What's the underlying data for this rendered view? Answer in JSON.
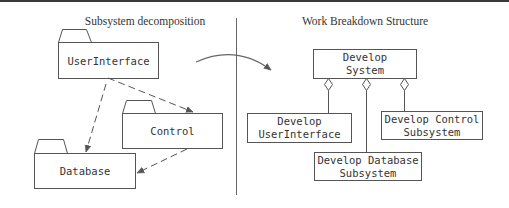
{
  "left_panel": {
    "title": "Subsystem decomposition",
    "packages": [
      {
        "id": "userinterface",
        "label": "UserInterface"
      },
      {
        "id": "control",
        "label": "Control"
      },
      {
        "id": "database",
        "label": "Database"
      }
    ],
    "dependencies": [
      {
        "from": "UserInterface",
        "to": "Control",
        "style": "dashed"
      },
      {
        "from": "UserInterface",
        "to": "Database",
        "style": "dashed"
      },
      {
        "from": "Control",
        "to": "Database",
        "style": "dashed"
      }
    ]
  },
  "right_panel": {
    "title": "Work Breakdown Structure",
    "root": {
      "line1": "Develop",
      "line2": "System"
    },
    "children": [
      {
        "line1": "Develop",
        "line2": "UserInterface"
      },
      {
        "line1": "Develop Database",
        "line2": "Subsystem"
      },
      {
        "line1": "Develop Control",
        "line2": "Subsystem"
      }
    ],
    "relation": "aggregation"
  },
  "colors": {
    "line": "#555555",
    "text": "#333333",
    "rule": "#3a3a3a"
  }
}
